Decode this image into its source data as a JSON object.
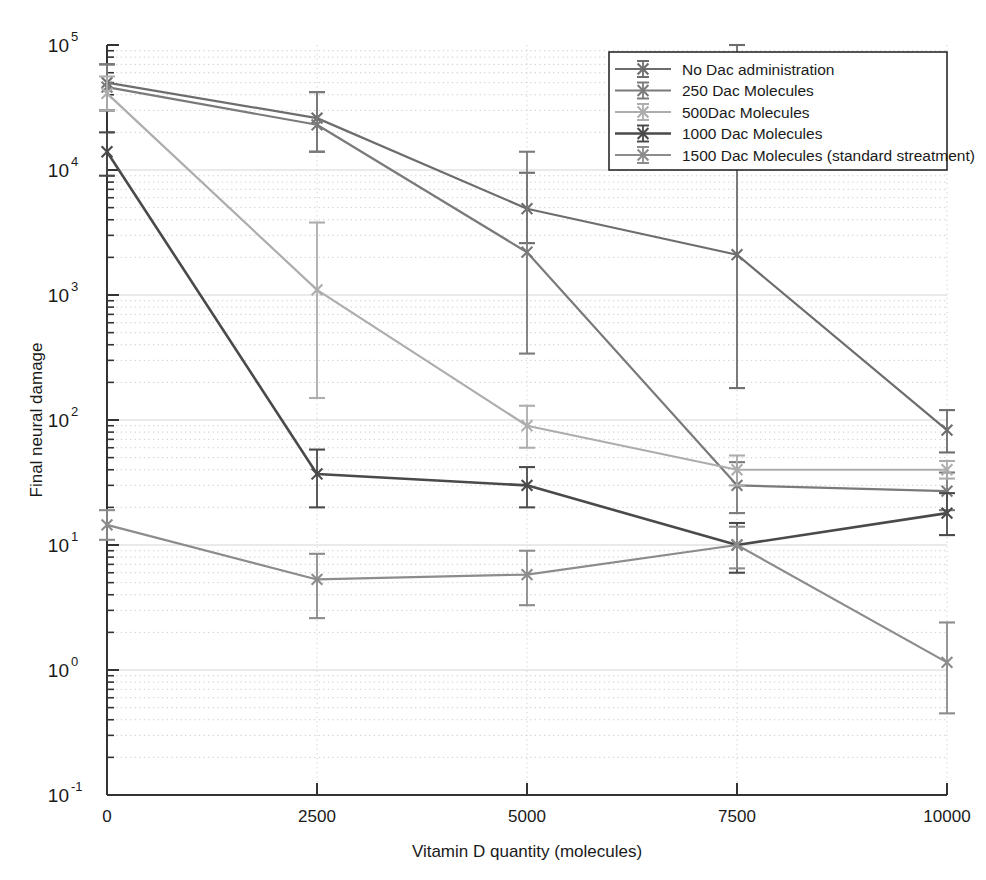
{
  "chart_data": {
    "type": "line",
    "title": "",
    "xlabel": "Vitamin D quantity (molecules)",
    "ylabel": "Final neural damage",
    "x": [
      0,
      2500,
      5000,
      7500,
      10000
    ],
    "xtick_labels": [
      "0",
      "2500",
      "5000",
      "7500",
      "10000"
    ],
    "xlim": [
      0,
      10000
    ],
    "yscale": "log",
    "ylim": [
      0.1,
      100000
    ],
    "ytick_labels": [
      "10^-1",
      "10^0",
      "10^1",
      "10^2",
      "10^3",
      "10^4",
      "10^5"
    ],
    "ytick_bases": [
      "10",
      "10",
      "10",
      "10",
      "10",
      "10",
      "10"
    ],
    "ytick_exponents": [
      "-1",
      "0",
      "1",
      "2",
      "3",
      "4",
      "5"
    ],
    "grid": "both-minor-dotted-major-solid",
    "legend_position": "top-right",
    "series": [
      {
        "name": "No Dac administration",
        "color": "#6d6d6d",
        "values": [
          50000,
          26000,
          4900,
          2100,
          83
        ],
        "err_low": [
          30000,
          14000,
          2600,
          180,
          55
        ],
        "err_high": [
          70000,
          42000,
          9500,
          130000,
          120
        ]
      },
      {
        "name": "250 Dac Molecules",
        "color": "#7a7a7a",
        "values": [
          46000,
          23000,
          2200,
          30,
          27
        ],
        "err_low": [
          30000,
          14000,
          340,
          18,
          19
        ],
        "err_high": [
          70000,
          42000,
          14000,
          46,
          38
        ]
      },
      {
        "name": "500Dac Molecules",
        "color": "#adadad",
        "values": [
          41000,
          1100,
          90,
          40,
          40
        ],
        "err_low": [
          30000,
          150,
          60,
          30,
          34
        ],
        "err_high": [
          56000,
          3800,
          130,
          52,
          47
        ]
      },
      {
        "name": "1000 Dac Molecules",
        "color": "#4a4a4a",
        "values": [
          14000,
          37,
          30,
          10,
          18
        ],
        "err_low": [
          9000,
          20,
          20,
          6,
          12
        ],
        "err_high": [
          20000,
          58,
          42,
          15,
          26
        ]
      },
      {
        "name": "1500  Dac Molecules (standard streatment)",
        "color": "#8c8c8c",
        "values": [
          14.5,
          5.3,
          5.8,
          10,
          1.15
        ],
        "err_low": [
          11,
          2.6,
          3.3,
          6.5,
          0.45
        ],
        "err_high": [
          19,
          8.5,
          9.0,
          14,
          2.4
        ]
      }
    ]
  },
  "legend": {
    "items": [
      {
        "label": "No Dac administration"
      },
      {
        "label": "250 Dac Molecules"
      },
      {
        "label": "500Dac Molecules"
      },
      {
        "label": "1000 Dac Molecules"
      },
      {
        "label": "1500  Dac Molecules (standard streatment)"
      }
    ]
  }
}
